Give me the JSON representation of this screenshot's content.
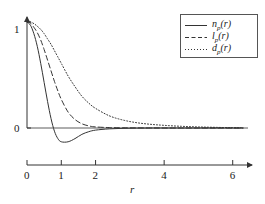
{
  "chart_data": {
    "type": "line",
    "title": "",
    "xlabel": "r",
    "ylabel": "",
    "xlim": [
      0,
      6.3
    ],
    "ylim": [
      -0.22,
      1.08
    ],
    "xticks": [
      0,
      1,
      2,
      4,
      6
    ],
    "xtick_labels": [
      "0",
      "1",
      "2",
      "4",
      "6"
    ],
    "yticks": [
      0,
      1
    ],
    "ytick_labels": [
      "0",
      "1"
    ],
    "grid": false,
    "legend_position": "top-right",
    "x": [
      0,
      0.1,
      0.2,
      0.3,
      0.4,
      0.5,
      0.6,
      0.7,
      0.8,
      0.9,
      1.0,
      1.2,
      1.4,
      1.6,
      1.8,
      2.0,
      2.4,
      2.8,
      3.2,
      3.6,
      4.0,
      4.5,
      5.0,
      5.5,
      6.0,
      6.3
    ],
    "series": [
      {
        "name": "n_p(r)",
        "label": "n",
        "label_sub": "p",
        "label_arg": "(r)",
        "style": "solid",
        "color": "#333333",
        "values": [
          1.0,
          0.97,
          0.89,
          0.77,
          0.61,
          0.43,
          0.25,
          0.09,
          -0.03,
          -0.1,
          -0.13,
          -0.13,
          -0.1,
          -0.06,
          -0.035,
          -0.02,
          -0.008,
          -0.003,
          -0.001,
          0.0,
          0.0,
          0.0,
          0.0,
          0.0,
          0.0,
          0.0
        ]
      },
      {
        "name": "l_p(r)",
        "label": "l",
        "label_sub": "p",
        "label_arg": "(r)",
        "style": "dashed",
        "color": "#333333",
        "values": [
          1.0,
          0.99,
          0.95,
          0.9,
          0.83,
          0.74,
          0.64,
          0.54,
          0.44,
          0.35,
          0.27,
          0.15,
          0.08,
          0.04,
          0.02,
          0.01,
          0.004,
          0.002,
          0.001,
          0.0,
          0.0,
          0.0,
          0.0,
          0.0,
          0.0,
          0.0
        ]
      },
      {
        "name": "d_p(r)",
        "label": "d",
        "label_sub": "p",
        "label_arg": "(r)",
        "style": "dotted",
        "color": "#333333",
        "values": [
          1.0,
          1.0,
          0.985,
          0.96,
          0.93,
          0.89,
          0.84,
          0.79,
          0.73,
          0.67,
          0.61,
          0.49,
          0.39,
          0.3,
          0.235,
          0.185,
          0.115,
          0.075,
          0.05,
          0.035,
          0.025,
          0.016,
          0.01,
          0.006,
          0.003,
          0.002
        ]
      }
    ]
  }
}
